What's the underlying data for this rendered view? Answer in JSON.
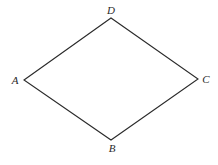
{
  "diagram": {
    "type": "quadrilateral",
    "shape": "rhombus",
    "stroke_color": "#2a2a2a",
    "background": "#ffffff",
    "vertices": [
      {
        "name": "A",
        "x": 24,
        "y": 80,
        "label_x": 15,
        "label_y": 84
      },
      {
        "name": "B",
        "x": 111,
        "y": 140,
        "label_x": 112,
        "label_y": 152
      },
      {
        "name": "C",
        "x": 198,
        "y": 79,
        "label_x": 206,
        "label_y": 83
      },
      {
        "name": "D",
        "x": 111,
        "y": 18,
        "label_x": 111,
        "label_y": 14
      }
    ],
    "edges": [
      {
        "from": "A",
        "to": "D"
      },
      {
        "from": "D",
        "to": "C"
      },
      {
        "from": "C",
        "to": "B"
      },
      {
        "from": "B",
        "to": "A"
      }
    ]
  }
}
